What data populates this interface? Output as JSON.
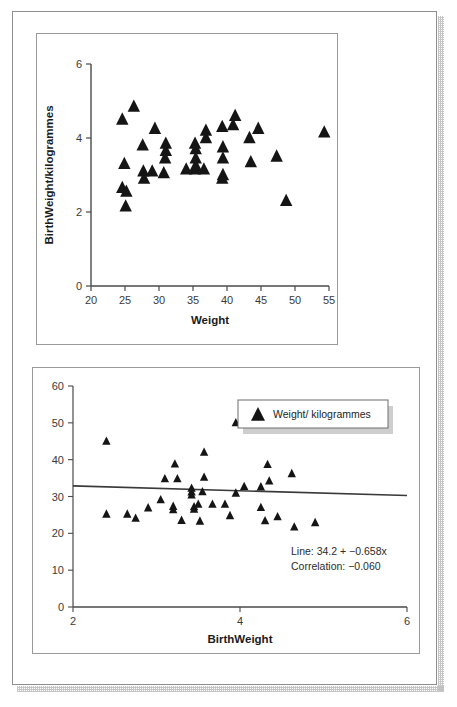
{
  "chart_data": [
    {
      "id": "top",
      "type": "scatter",
      "title": "",
      "xlabel": "Weight",
      "ylabel": "BirthWeight/kilogrammes",
      "xlim": [
        20,
        55
      ],
      "ylim": [
        0,
        6
      ],
      "xticks": [
        20,
        25,
        30,
        35,
        40,
        45,
        50,
        55
      ],
      "yticks": [
        0,
        2,
        4,
        6
      ],
      "grid": false,
      "legend": null,
      "marker": "triangle",
      "marker_color": "#151515",
      "points": [
        {
          "x": 24.6,
          "y": 4.5
        },
        {
          "x": 26.3,
          "y": 4.85
        },
        {
          "x": 24.9,
          "y": 3.3
        },
        {
          "x": 24.6,
          "y": 2.65
        },
        {
          "x": 25.2,
          "y": 2.55
        },
        {
          "x": 25.1,
          "y": 2.15
        },
        {
          "x": 27.6,
          "y": 3.8
        },
        {
          "x": 27.7,
          "y": 3.1
        },
        {
          "x": 27.8,
          "y": 2.9
        },
        {
          "x": 29.0,
          "y": 3.1
        },
        {
          "x": 29.4,
          "y": 4.25
        },
        {
          "x": 30.7,
          "y": 3.05
        },
        {
          "x": 31.0,
          "y": 3.85
        },
        {
          "x": 31.0,
          "y": 3.65
        },
        {
          "x": 30.9,
          "y": 3.45
        },
        {
          "x": 34.0,
          "y": 3.15
        },
        {
          "x": 35.3,
          "y": 3.85
        },
        {
          "x": 35.4,
          "y": 3.7
        },
        {
          "x": 35.4,
          "y": 3.45
        },
        {
          "x": 35.4,
          "y": 3.25
        },
        {
          "x": 35.3,
          "y": 3.15
        },
        {
          "x": 36.6,
          "y": 3.15
        },
        {
          "x": 36.9,
          "y": 4.2
        },
        {
          "x": 36.9,
          "y": 4.0
        },
        {
          "x": 39.3,
          "y": 4.3
        },
        {
          "x": 39.4,
          "y": 3.75
        },
        {
          "x": 39.4,
          "y": 3.45
        },
        {
          "x": 39.4,
          "y": 3.0
        },
        {
          "x": 39.3,
          "y": 2.9
        },
        {
          "x": 41.2,
          "y": 4.6
        },
        {
          "x": 40.9,
          "y": 4.35
        },
        {
          "x": 43.3,
          "y": 4.0
        },
        {
          "x": 44.6,
          "y": 4.25
        },
        {
          "x": 43.5,
          "y": 3.35
        },
        {
          "x": 47.3,
          "y": 3.5
        },
        {
          "x": 48.7,
          "y": 2.3
        },
        {
          "x": 54.3,
          "y": 4.15
        }
      ]
    },
    {
      "id": "bottom",
      "type": "scatter",
      "title": "",
      "xlabel": "BirthWeight",
      "ylabel": "",
      "xlim": [
        2,
        6
      ],
      "ylim": [
        0,
        60
      ],
      "xticks": [
        2,
        4,
        6
      ],
      "yticks": [
        0,
        10,
        20,
        30,
        40,
        50,
        60
      ],
      "grid": false,
      "marker": "triangle",
      "marker_color": "#151515",
      "legend": {
        "position": "top-right",
        "entries": [
          {
            "label": "Weight/ kilogrammes",
            "marker": "triangle",
            "color": "#151515"
          }
        ]
      },
      "fit_line": {
        "intercept": 34.2,
        "slope": -0.658,
        "color": "#3a3a3a"
      },
      "annotations": [
        "Line: 34.2 + −0.658x",
        "Correlation: −0.060"
      ],
      "points": [
        {
          "x": 2.4,
          "y": 45.0
        },
        {
          "x": 2.4,
          "y": 25.2
        },
        {
          "x": 2.65,
          "y": 25.2
        },
        {
          "x": 2.75,
          "y": 24.1
        },
        {
          "x": 2.9,
          "y": 26.9
        },
        {
          "x": 3.05,
          "y": 29.1
        },
        {
          "x": 3.1,
          "y": 34.8
        },
        {
          "x": 3.22,
          "y": 38.8
        },
        {
          "x": 3.25,
          "y": 34.8
        },
        {
          "x": 3.2,
          "y": 27.3
        },
        {
          "x": 3.2,
          "y": 26.4
        },
        {
          "x": 3.3,
          "y": 23.5
        },
        {
          "x": 3.42,
          "y": 32.2
        },
        {
          "x": 3.42,
          "y": 31.2
        },
        {
          "x": 3.42,
          "y": 30.4
        },
        {
          "x": 3.45,
          "y": 27.2
        },
        {
          "x": 3.45,
          "y": 26.5
        },
        {
          "x": 3.52,
          "y": 23.3
        },
        {
          "x": 3.57,
          "y": 42.0
        },
        {
          "x": 3.57,
          "y": 35.2
        },
        {
          "x": 3.55,
          "y": 31.3
        },
        {
          "x": 3.5,
          "y": 27.9
        },
        {
          "x": 3.67,
          "y": 27.9
        },
        {
          "x": 3.82,
          "y": 27.9
        },
        {
          "x": 3.95,
          "y": 50.0
        },
        {
          "x": 3.95,
          "y": 30.9
        },
        {
          "x": 3.88,
          "y": 24.8
        },
        {
          "x": 4.05,
          "y": 32.7
        },
        {
          "x": 4.25,
          "y": 32.6
        },
        {
          "x": 4.25,
          "y": 27.0
        },
        {
          "x": 4.3,
          "y": 23.4
        },
        {
          "x": 4.33,
          "y": 38.7
        },
        {
          "x": 4.35,
          "y": 34.2
        },
        {
          "x": 4.45,
          "y": 24.5
        },
        {
          "x": 4.62,
          "y": 36.2
        },
        {
          "x": 4.65,
          "y": 21.7
        },
        {
          "x": 4.9,
          "y": 22.9
        }
      ]
    }
  ]
}
